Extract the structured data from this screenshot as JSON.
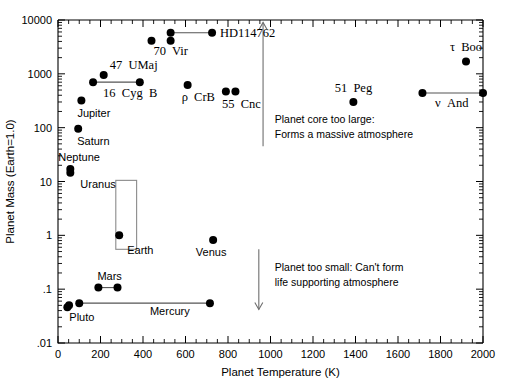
{
  "chart_data": {
    "type": "scatter",
    "title": "",
    "xlabel": "Planet Temperature (K)",
    "ylabel": "Planet Mass (Earth=1.0)",
    "xlim": [
      0,
      2000
    ],
    "ylim": [
      0.01,
      10000
    ],
    "yscale": "log",
    "xscale": "linear",
    "grid": false,
    "legend": "none",
    "xticks": [
      "0",
      "200",
      "400",
      "600",
      "800",
      "1000",
      "1200",
      "1400",
      "1600",
      "1800",
      "2000"
    ],
    "xtick_values": [
      0,
      200,
      400,
      600,
      800,
      1000,
      1200,
      1400,
      1600,
      1800,
      2000
    ],
    "yticks": [
      ".01",
      ".1",
      "1",
      "10",
      "100",
      "1000",
      "10000"
    ],
    "ytick_values": [
      0.01,
      0.1,
      1,
      10,
      100,
      1000,
      10000
    ],
    "points": [
      {
        "name": "Pluto",
        "label": "Pluto",
        "temp": 44,
        "mass": 0.046
      },
      {
        "name": "Pluto-b",
        "label": "",
        "temp": 52,
        "mass": 0.05
      },
      {
        "name": "Mercury-left",
        "label": "",
        "temp": 100,
        "mass": 0.055
      },
      {
        "name": "Mercury-right",
        "label": "Mercury",
        "temp": 715,
        "mass": 0.055
      },
      {
        "name": "Mars-left",
        "label": "Mars",
        "temp": 190,
        "mass": 0.107
      },
      {
        "name": "Mars-right",
        "label": "",
        "temp": 280,
        "mass": 0.107
      },
      {
        "name": "Earth",
        "label": "Earth",
        "temp": 288,
        "mass": 1.0
      },
      {
        "name": "Venus",
        "label": "Venus",
        "temp": 730,
        "mass": 0.82
      },
      {
        "name": "Uranus",
        "label": "Uranus",
        "temp": 58,
        "mass": 14.5
      },
      {
        "name": "Neptune",
        "label": "Neptune",
        "temp": 58,
        "mass": 17.1
      },
      {
        "name": "Saturn",
        "label": "Saturn",
        "temp": 95,
        "mass": 95
      },
      {
        "name": "Jupiter",
        "label": "Jupiter",
        "temp": 110,
        "mass": 318
      },
      {
        "name": "16-Cyg-B-left",
        "label": "16  Cyg  B",
        "temp": 165,
        "mass": 700
      },
      {
        "name": "16-Cyg-B-right",
        "label": "",
        "temp": 385,
        "mass": 700
      },
      {
        "name": "47-UMaj",
        "label": "47  UMaj",
        "temp": 215,
        "mass": 950
      },
      {
        "name": "70-Vir",
        "label": "70  Vir",
        "temp": 440,
        "mass": 4100
      },
      {
        "name": "70-Vir-b",
        "label": "",
        "temp": 530,
        "mass": 4100
      },
      {
        "name": "HD114762-left",
        "label": "",
        "temp": 530,
        "mass": 5800
      },
      {
        "name": "HD114762-right",
        "label": "HD114762",
        "temp": 725,
        "mass": 5800
      },
      {
        "name": "rho-CrB",
        "label": "ρ  CrB",
        "temp": 610,
        "mass": 620
      },
      {
        "name": "55-Cnc-a",
        "label": "55  Cnc",
        "temp": 790,
        "mass": 470
      },
      {
        "name": "55-Cnc-b",
        "label": "",
        "temp": 835,
        "mass": 470
      },
      {
        "name": "51-Peg",
        "label": "51  Peg",
        "temp": 1390,
        "mass": 300
      },
      {
        "name": "nu-And-left",
        "label": "",
        "temp": 1715,
        "mass": 440
      },
      {
        "name": "nu-And-right",
        "label": "ν  And",
        "temp": 2000,
        "mass": 440
      },
      {
        "name": "tau-Boo",
        "label": "τ  Boo",
        "temp": 1920,
        "mass": 1700
      }
    ],
    "connectors": [
      {
        "name": "mercury-range",
        "x0": 100,
        "x1": 715,
        "y": 0.055
      },
      {
        "name": "mars-range",
        "x0": 190,
        "x1": 280,
        "y": 0.107
      },
      {
        "name": "16-cyg-b-range",
        "x0": 165,
        "x1": 385,
        "y": 700
      },
      {
        "name": "hd114762-range",
        "x0": 530,
        "x1": 725,
        "y": 5800
      },
      {
        "name": "nu-and-range",
        "x0": 1715,
        "x1": 2000,
        "y": 440
      }
    ],
    "habitable_zone_box": {
      "name": "habitable-zone-box",
      "x0": 272,
      "x1": 370,
      "y0": 0.55,
      "y1": 10.5
    },
    "annotations": [
      {
        "name": "planet-core-too-large",
        "line1": "Planet core too large:",
        "line2": "Forms a massive atmosphere",
        "x": 1020,
        "y_top": 120
      },
      {
        "name": "planet-too-small",
        "line1": "Planet too small: Can't form",
        "line2": "life supporting atmosphere",
        "x": 1020,
        "y_top": 0.22
      }
    ],
    "arrows": [
      {
        "name": "upward-arrow",
        "direction": "up",
        "x": 965,
        "y_tail": 45,
        "y_head": 9000
      },
      {
        "name": "downward-arrow",
        "direction": "down",
        "x": 945,
        "y_tail": 0.55,
        "y_head": 0.042
      }
    ]
  },
  "colors": {
    "marker": "#000000",
    "axis": "#000000",
    "connector": "#555555",
    "box": "#8a8a8a",
    "arrow": "#6e6e6e",
    "background": "#ffffff"
  }
}
